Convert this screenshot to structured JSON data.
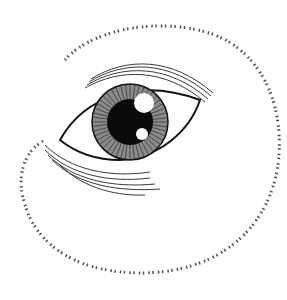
{
  "image": {
    "subject": "eye-line-drawing",
    "colors": {
      "background": "#ffffff",
      "ink": "#111111",
      "iris_fill": "#7a7a7a",
      "highlight": "#ffffff"
    }
  }
}
